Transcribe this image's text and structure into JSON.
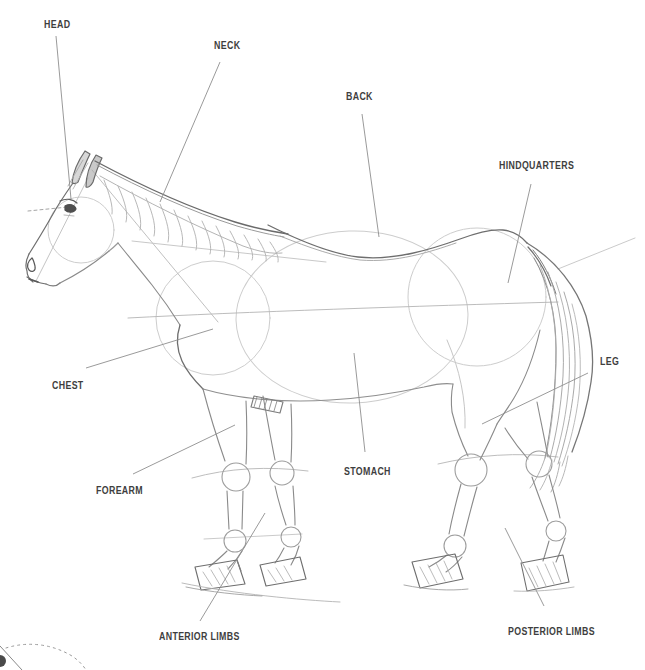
{
  "page": {
    "width": 645,
    "height": 670,
    "background_color": "#ffffff"
  },
  "figure": {
    "kind": "horse-anatomy-sketch-diagram",
    "label_color": "#3e3e3e",
    "leader_color": "#8f8f8f",
    "pencil_colors": {
      "light": "#cdcdcd",
      "mid": "#a6a6a6",
      "dark": "#7b7b7b",
      "deep": "#5a5a5a"
    },
    "labels": [
      {
        "id": "head",
        "text": "HEAD",
        "x": 44,
        "y": 20,
        "leader": {
          "x1": 56,
          "y1": 36,
          "x2": 71,
          "y2": 199
        }
      },
      {
        "id": "neck",
        "text": "NECK",
        "x": 214,
        "y": 41,
        "leader": {
          "x1": 220,
          "y1": 62,
          "x2": 160,
          "y2": 202
        }
      },
      {
        "id": "back",
        "text": "BACK",
        "x": 346,
        "y": 92,
        "leader": {
          "x1": 362,
          "y1": 114,
          "x2": 379,
          "y2": 237
        }
      },
      {
        "id": "hindquarters",
        "text": "HINDQUARTERS",
        "x": 499,
        "y": 161,
        "leader": {
          "x1": 531,
          "y1": 184,
          "x2": 508,
          "y2": 283
        }
      },
      {
        "id": "chest",
        "text": "CHEST",
        "x": 52,
        "y": 381,
        "leader": {
          "x1": 86,
          "y1": 368,
          "x2": 213,
          "y2": 329
        }
      },
      {
        "id": "stomach",
        "text": "STOMACH",
        "x": 344,
        "y": 467,
        "leader": {
          "x1": 354,
          "y1": 353,
          "x2": 365,
          "y2": 452
        }
      },
      {
        "id": "leg",
        "text": "LEG",
        "x": 600,
        "y": 357,
        "leader": {
          "x1": 588,
          "y1": 373,
          "x2": 482,
          "y2": 424
        }
      },
      {
        "id": "forearm",
        "text": "FOREARM",
        "x": 96,
        "y": 486,
        "leader": {
          "x1": 133,
          "y1": 474,
          "x2": 235,
          "y2": 425
        }
      },
      {
        "id": "anterior_limbs",
        "text": "ANTERIOR LIMBS",
        "x": 159,
        "y": 632,
        "leader": {
          "x1": 200,
          "y1": 621,
          "x2": 265,
          "y2": 513
        }
      },
      {
        "id": "posterior_limbs",
        "text": "POSTERIOR LIMBS",
        "x": 508,
        "y": 627,
        "leader": {
          "x1": 544,
          "y1": 606,
          "x2": 505,
          "y2": 528
        }
      }
    ]
  }
}
